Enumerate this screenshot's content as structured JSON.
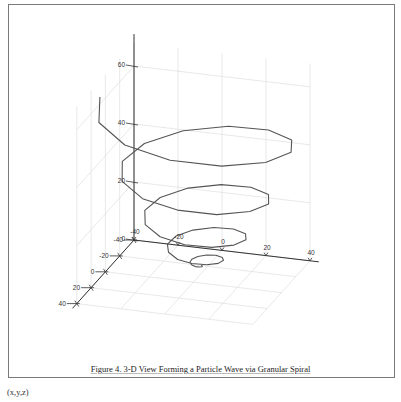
{
  "figure": {
    "caption": "Figure 4. 3-D View Forming a Particle Wave via Granular Spiral",
    "footnote": "(x,y,z)"
  },
  "chart_data": {
    "type": "line3d",
    "title": "",
    "caption": "Figure 4. 3-D View Forming a Particle Wave via Granular Spiral",
    "xlabel": "",
    "ylabel": "",
    "zlabel": "",
    "xlim": [
      -40,
      40
    ],
    "ylim": [
      -40,
      40
    ],
    "zlim": [
      0,
      60
    ],
    "x_ticks": [
      -40,
      -20,
      0,
      20,
      40
    ],
    "y_ticks": [
      -40,
      -20,
      0,
      20,
      40
    ],
    "z_ticks": [
      0,
      20,
      40,
      60
    ],
    "grid": true,
    "legend": "none",
    "colors": {
      "line": "#555555",
      "axis": "#333333",
      "grid": "#e2e2e2",
      "frame": "#7a7a7a"
    },
    "series": [
      {
        "name": "granular spiral",
        "points": [
          [
            -3,
            -20,
            0
          ],
          [
            -2.3,
            -19.6,
            0.0
          ],
          [
            -2.1,
            -18.5,
            0.1
          ],
          [
            -3,
            -17.4,
            0.2
          ],
          [
            -4.7,
            -17.0,
            0.3
          ],
          [
            -6.7,
            -17.9,
            0.5
          ],
          [
            -8.1,
            -20,
            0.7
          ],
          [
            -8.2,
            -23.0,
            0.9
          ],
          [
            -6.4,
            -25.9,
            1.2
          ],
          [
            -3,
            -27.7,
            1.5
          ],
          [
            1.3,
            -27.4,
            1.9
          ],
          [
            5.1,
            -24.7,
            2.2
          ],
          [
            7.2,
            -20,
            2.7
          ],
          [
            6.6,
            -14.5,
            3.1
          ],
          [
            3.0,
            -9.7,
            3.6
          ],
          [
            -3,
            -7.2,
            4.2
          ],
          [
            -9.8,
            -8.2,
            4.7
          ],
          [
            -15.5,
            -12.8,
            5.4
          ],
          [
            -18.3,
            -20,
            6.0
          ],
          [
            -17.0,
            -28.1,
            6.7
          ],
          [
            -11.5,
            -34.8,
            7.4
          ],
          [
            -3,
            -37.9,
            8.2
          ],
          [
            6.4,
            -36.2,
            9.0
          ],
          [
            14.0,
            -29.8,
            9.8
          ],
          [
            17.4,
            -20,
            10.7
          ],
          [
            15.4,
            -9.4,
            11.6
          ],
          [
            8.1,
            -0.8,
            12.5
          ],
          [
            -3,
            3.0,
            13.5
          ],
          [
            -14.9,
            0.7,
            14.5
          ],
          [
            -24.4,
            -7.6,
            15.6
          ],
          [
            -28.6,
            -20,
            16.7
          ],
          [
            -25.9,
            -33.2,
            17.8
          ],
          [
            -16.6,
            -43.6,
            19.0
          ],
          [
            -3,
            -48.1,
            20.2
          ],
          [
            11.5,
            -45.1,
            21.4
          ],
          [
            22.8,
            -34.9,
            22.7
          ],
          [
            27.7,
            -20,
            24.0
          ],
          [
            24.3,
            -4.2,
            25.4
          ],
          [
            13.2,
            8.0,
            26.7
          ],
          [
            -3,
            13.2,
            28.2
          ],
          [
            -20.0,
            9.5,
            29.6
          ],
          [
            -33.2,
            -2.5,
            31.1
          ],
          [
            -38.8,
            -20,
            32.7
          ],
          [
            -34.7,
            -38.3,
            34.2
          ],
          [
            -21.7,
            -52.5,
            35.9
          ],
          [
            -3,
            -58.3,
            37.5
          ],
          [
            16.6,
            -53.9,
            39.2
          ],
          [
            31.7,
            -40.0,
            40.9
          ],
          [
            37.9,
            -20,
            42.7
          ],
          [
            33.1,
            0.9,
            44.5
          ],
          [
            18.3,
            16.9,
            46.3
          ],
          [
            -3,
            23.4,
            48.2
          ],
          [
            -25.2,
            18.4,
            50.1
          ],
          [
            -42.1,
            2.6,
            52.0
          ],
          [
            -49.0,
            -20,
            54.0
          ]
        ]
      }
    ]
  }
}
